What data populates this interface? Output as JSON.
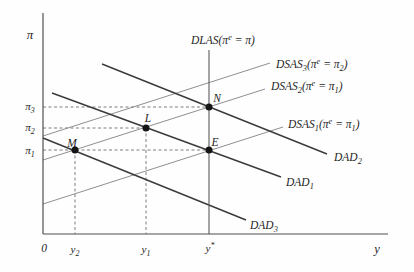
{
  "figure": {
    "kind": "DAD-DSAS disinflation diagram",
    "background": "#fefefe",
    "ink": "#1f1f1f",
    "colors": {
      "dad": "#3a3a3a",
      "dsas": "#8f8f8f",
      "axis": "#4f4f4f",
      "dash": "#707070"
    }
  },
  "diagram": {
    "lines": [
      {
        "name": "guide-pi3-to-N",
        "cls": "dash",
        "x1": 43,
        "y1": 107,
        "x2": 209,
        "y2": 107
      },
      {
        "name": "guide-pi2-to-L",
        "cls": "dash",
        "x1": 43,
        "y1": 128,
        "x2": 146,
        "y2": 128
      },
      {
        "name": "guide-pi1-to-E",
        "cls": "dash",
        "x1": 43,
        "y1": 150,
        "x2": 209,
        "y2": 150
      },
      {
        "name": "guide-y2-to-M",
        "cls": "dash",
        "x1": 75,
        "y1": 150,
        "x2": 75,
        "y2": 234
      },
      {
        "name": "guide-y1-to-L",
        "cls": "dash",
        "x1": 146,
        "y1": 128,
        "x2": 146,
        "y2": 234
      },
      {
        "name": "dsas3-curve",
        "cls": "dsas",
        "x1": 43,
        "y1": 136,
        "x2": 270,
        "y2": 63
      },
      {
        "name": "dsas2-curve",
        "cls": "dsas",
        "x1": 43,
        "y1": 160,
        "x2": 265,
        "y2": 89
      },
      {
        "name": "dsas1-curve",
        "cls": "dsas",
        "x1": 43,
        "y1": 204,
        "x2": 283,
        "y2": 127
      },
      {
        "name": "dad2-curve",
        "cls": "dad",
        "x1": 102,
        "y1": 64,
        "x2": 327,
        "y2": 154
      },
      {
        "name": "dad1-curve",
        "cls": "dad",
        "x1": 52,
        "y1": 93,
        "x2": 281,
        "y2": 177
      },
      {
        "name": "dad3-curve",
        "cls": "dad",
        "x1": 43,
        "y1": 138,
        "x2": 246,
        "y2": 220
      },
      {
        "name": "dlas-line",
        "cls": "dlas",
        "x1": 209,
        "y1": 50,
        "x2": 209,
        "y2": 234
      },
      {
        "name": "pi-axis",
        "cls": "axis",
        "x1": 43,
        "y1": 13,
        "x2": 43,
        "y2": 234
      },
      {
        "name": "y-axis",
        "cls": "axis",
        "x1": 43,
        "y1": 234,
        "x2": 388,
        "y2": 234
      }
    ],
    "points": [
      {
        "name": "point-M",
        "x": 75,
        "y": 150,
        "r": 3.5
      },
      {
        "name": "point-L",
        "x": 146,
        "y": 128,
        "r": 3.5
      },
      {
        "name": "point-N",
        "x": 209,
        "y": 107,
        "r": 3.5
      },
      {
        "name": "point-E",
        "x": 209,
        "y": 150,
        "r": 3.5
      }
    ],
    "labels": [
      {
        "name": "pi-axis-label",
        "text": "π",
        "x": 30,
        "y": 39,
        "size": 13,
        "anchor": "middle"
      },
      {
        "name": "y-axis-label",
        "text": "y",
        "x": 377,
        "y": 253,
        "size": 12.5,
        "anchor": "middle"
      },
      {
        "name": "origin-label",
        "text": "0",
        "x": 44,
        "y": 252,
        "size": 11.5,
        "anchor": "middle"
      },
      {
        "name": "tick-pi3",
        "text": "π_3",
        "x": 30,
        "y": 110,
        "size": 11,
        "anchor": "middle"
      },
      {
        "name": "tick-pi2",
        "text": "π_2",
        "x": 30,
        "y": 131,
        "size": 11,
        "anchor": "middle"
      },
      {
        "name": "tick-pi1",
        "text": "π_1",
        "x": 30,
        "y": 154,
        "size": 11,
        "anchor": "middle"
      },
      {
        "name": "tick-y2",
        "text": "y_2",
        "x": 75,
        "y": 253,
        "size": 11,
        "anchor": "middle"
      },
      {
        "name": "tick-y1",
        "text": "y_1",
        "x": 146,
        "y": 253,
        "size": 11,
        "anchor": "middle"
      },
      {
        "name": "tick-ystar",
        "text": "y^*",
        "x": 210,
        "y": 252,
        "size": 11,
        "anchor": "middle"
      },
      {
        "name": "dlas-label",
        "text": "DLAS(π^e = π)",
        "x": 223,
        "y": 44,
        "size": 11.5,
        "anchor": "middle"
      },
      {
        "name": "dsas3-label",
        "text": "DSAS_3(π^e = π_2)",
        "x": 276,
        "y": 68,
        "size": 11.5,
        "anchor": "start"
      },
      {
        "name": "dsas2-label",
        "text": "DSAS_2(π^e = π_1)",
        "x": 271,
        "y": 90,
        "size": 11.5,
        "anchor": "start"
      },
      {
        "name": "dsas1-label",
        "text": "DSAS_1(π^e = π_1)",
        "x": 288,
        "y": 128,
        "size": 11.5,
        "anchor": "start"
      },
      {
        "name": "dad2-label",
        "text": "DAD_2",
        "x": 334,
        "y": 161,
        "size": 11.5,
        "anchor": "start"
      },
      {
        "name": "dad1-label",
        "text": "DAD_1",
        "x": 286,
        "y": 186,
        "size": 11.5,
        "anchor": "start"
      },
      {
        "name": "dad3-label",
        "text": "DAD_3",
        "x": 250,
        "y": 229,
        "size": 11.5,
        "anchor": "start"
      },
      {
        "name": "point-M-label",
        "text": "M",
        "x": 72,
        "y": 147,
        "size": 11.5,
        "anchor": "middle"
      },
      {
        "name": "point-L-label",
        "text": "L",
        "x": 148,
        "y": 122,
        "size": 11.5,
        "anchor": "middle"
      },
      {
        "name": "point-N-label",
        "text": "N",
        "x": 217,
        "y": 102,
        "size": 11.5,
        "anchor": "middle"
      },
      {
        "name": "point-E-label",
        "text": "E",
        "x": 215,
        "y": 146,
        "size": 11.5,
        "anchor": "middle"
      }
    ]
  }
}
